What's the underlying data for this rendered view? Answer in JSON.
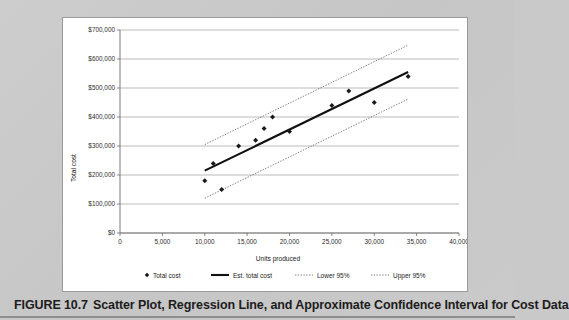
{
  "figure": {
    "caption_number": "FIGURE 10.7",
    "caption_text": "Scatter Plot, Regression Line, and Approximate Confidence Interval for Cost Data"
  },
  "chart_data": {
    "type": "scatter",
    "title": "",
    "xlabel": "Units produced",
    "ylabel": "Total cost",
    "xlim": [
      0,
      40000
    ],
    "ylim": [
      0,
      700000
    ],
    "grid": true,
    "legend_position": "bottom",
    "x_ticks": [
      0,
      5000,
      10000,
      15000,
      20000,
      25000,
      30000,
      35000,
      40000
    ],
    "x_tick_labels": [
      "0",
      "5,000",
      "10,000",
      "15,000",
      "20,000",
      "25,000",
      "30,000",
      "35,000",
      "40,000"
    ],
    "y_ticks": [
      0,
      100000,
      200000,
      300000,
      400000,
      500000,
      600000,
      700000
    ],
    "y_tick_labels": [
      "$0",
      "$100,000",
      "$200,000",
      "$300,000",
      "$400,000",
      "$500,000",
      "$600,000",
      "$700,000"
    ],
    "series": [
      {
        "name": "Total cost",
        "type": "scatter",
        "marker": "diamond",
        "color": "#1a1a1a",
        "points": [
          {
            "x": 10000,
            "y": 180000
          },
          {
            "x": 11000,
            "y": 240000
          },
          {
            "x": 12000,
            "y": 150000
          },
          {
            "x": 14000,
            "y": 300000
          },
          {
            "x": 16000,
            "y": 320000
          },
          {
            "x": 17000,
            "y": 360000
          },
          {
            "x": 18000,
            "y": 400000
          },
          {
            "x": 20000,
            "y": 350000
          },
          {
            "x": 25000,
            "y": 440000
          },
          {
            "x": 27000,
            "y": 490000
          },
          {
            "x": 30000,
            "y": 450000
          },
          {
            "x": 34000,
            "y": 540000
          }
        ]
      },
      {
        "name": "Est. total cost",
        "type": "line",
        "style": "solid",
        "color": "#111111",
        "points": [
          {
            "x": 10000,
            "y": 215000
          },
          {
            "x": 34000,
            "y": 555000
          }
        ]
      },
      {
        "name": "Lower 95%",
        "type": "line",
        "style": "dotted",
        "color": "#6a6a6a",
        "points": [
          {
            "x": 10000,
            "y": 120000
          },
          {
            "x": 34000,
            "y": 462000
          }
        ]
      },
      {
        "name": "Upper 95%",
        "type": "line",
        "style": "dotted",
        "color": "#6a6a6a",
        "points": [
          {
            "x": 10000,
            "y": 305000
          },
          {
            "x": 34000,
            "y": 648000
          }
        ]
      }
    ],
    "legend": [
      {
        "label": "Total cost",
        "marker": "diamond"
      },
      {
        "label": "Est. total cost",
        "marker": "solid-line"
      },
      {
        "label": "Lower 95%",
        "marker": "dotted-line"
      },
      {
        "label": "Upper 95%",
        "marker": "dotted-line"
      }
    ]
  }
}
